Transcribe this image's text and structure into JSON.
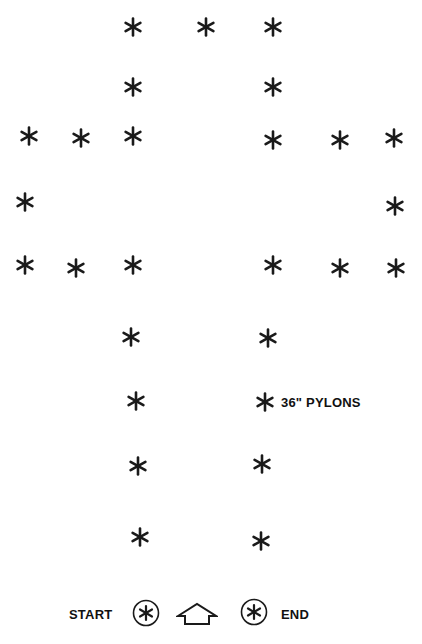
{
  "diagram": {
    "type": "pylon-course-layout",
    "pylon_color": "#1a1a1a",
    "pylons": [
      {
        "x": 133,
        "y": 27
      },
      {
        "x": 206,
        "y": 27
      },
      {
        "x": 273,
        "y": 27
      },
      {
        "x": 133,
        "y": 87
      },
      {
        "x": 273,
        "y": 87
      },
      {
        "x": 29,
        "y": 136
      },
      {
        "x": 81,
        "y": 138
      },
      {
        "x": 133,
        "y": 136
      },
      {
        "x": 273,
        "y": 140
      },
      {
        "x": 340,
        "y": 140
      },
      {
        "x": 394,
        "y": 138
      },
      {
        "x": 25,
        "y": 202
      },
      {
        "x": 395,
        "y": 206
      },
      {
        "x": 25,
        "y": 265
      },
      {
        "x": 76,
        "y": 268
      },
      {
        "x": 133,
        "y": 265
      },
      {
        "x": 273,
        "y": 265
      },
      {
        "x": 340,
        "y": 268
      },
      {
        "x": 396,
        "y": 268
      },
      {
        "x": 131,
        "y": 337
      },
      {
        "x": 268,
        "y": 338
      },
      {
        "x": 136,
        "y": 401
      },
      {
        "x": 265,
        "y": 402
      },
      {
        "x": 138,
        "y": 466
      },
      {
        "x": 262,
        "y": 464
      },
      {
        "x": 140,
        "y": 537
      },
      {
        "x": 261,
        "y": 541
      }
    ],
    "legend": {
      "pylon_label": "36\" PYLONS",
      "start_label": "START",
      "end_label": "END",
      "direction": "up-arrow"
    }
  }
}
